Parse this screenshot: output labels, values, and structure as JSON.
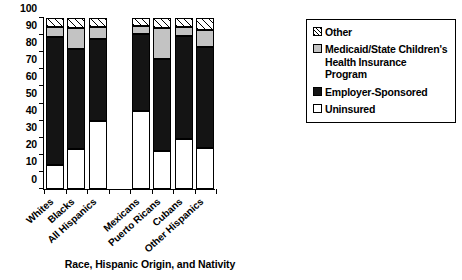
{
  "chart_data": {
    "type": "bar",
    "subtype": "stacked-100-percent",
    "title": "",
    "xlabel": "Race, Hispanic Origin, and Nativity",
    "ylabel": "",
    "ylim": [
      0,
      100
    ],
    "yticks": [
      0,
      10,
      20,
      30,
      40,
      50,
      60,
      70,
      80,
      90,
      100
    ],
    "grid": false,
    "legend_position": "right",
    "categories": [
      "Whites",
      "Blacks",
      "All Hispanics",
      "Mexicans",
      "Puerto Ricans",
      "Cubans",
      "Other Hispanics"
    ],
    "group_break_after": "All Hispanics",
    "series": [
      {
        "name": "Uninsured",
        "color": "#ffffff",
        "pattern": "solid",
        "values": [
          14.0,
          23.5,
          39.5,
          45.5,
          22.5,
          29.5,
          24.0
        ]
      },
      {
        "name": "Employer-Sponsored",
        "color": "#141414",
        "pattern": "solid",
        "values": [
          75.0,
          58.5,
          48.5,
          45.0,
          53.5,
          60.0,
          59.0
        ]
      },
      {
        "name": "Medicaid/State Children's Health Insurance Program",
        "color": "#c3c3c3",
        "pattern": "solid",
        "values": [
          6.0,
          12.0,
          7.0,
          5.0,
          18.0,
          5.5,
          10.0
        ]
      },
      {
        "name": "Other",
        "color": "#ffffff",
        "pattern": "hatched",
        "values": [
          5.0,
          6.0,
          5.0,
          4.5,
          6.0,
          5.0,
          7.0
        ]
      }
    ],
    "cumulative_tops": {
      "Whites": {
        "uninsured": 14.0,
        "employer": 89.0,
        "medicaid": 95.0,
        "other": 100
      },
      "Blacks": {
        "uninsured": 23.5,
        "employer": 82.0,
        "medicaid": 94.0,
        "other": 100
      },
      "All Hispanics": {
        "uninsured": 39.5,
        "employer": 88.0,
        "medicaid": 95.0,
        "other": 100
      },
      "Mexicans": {
        "uninsured": 45.5,
        "employer": 90.5,
        "medicaid": 95.5,
        "other": 100
      },
      "Puerto Ricans": {
        "uninsured": 22.5,
        "employer": 76.0,
        "medicaid": 94.0,
        "other": 100
      },
      "Cubans": {
        "uninsured": 29.5,
        "employer": 89.5,
        "medicaid": 95.0,
        "other": 100
      },
      "Other Hispanics": {
        "uninsured": 24.0,
        "employer": 83.0,
        "medicaid": 93.0,
        "other": 100
      }
    }
  },
  "legend": {
    "items": [
      {
        "label": "Other",
        "swatch": "hatched-swatch"
      },
      {
        "label": "Medicaid/State Children's Health Insurance Program",
        "swatch": "gray-swatch"
      },
      {
        "label": "Employer-Sponsored",
        "swatch": "black-swatch"
      },
      {
        "label": "Uninsured",
        "swatch": "white-swatch"
      }
    ]
  }
}
